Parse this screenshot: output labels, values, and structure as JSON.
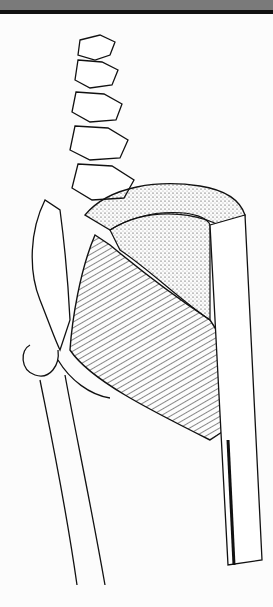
{
  "image": {
    "subject": "anatomical line illustration",
    "structures": [
      "lumbar-spine",
      "sacrum",
      "ilium",
      "gluteus-maximus",
      "gluteus-medius-fascia",
      "iliotibial-band",
      "femur",
      "greater-trochanter"
    ],
    "colors": {
      "background": "#fcfcfc",
      "ink": "#111111",
      "topbar": "#7a7a7a"
    }
  }
}
